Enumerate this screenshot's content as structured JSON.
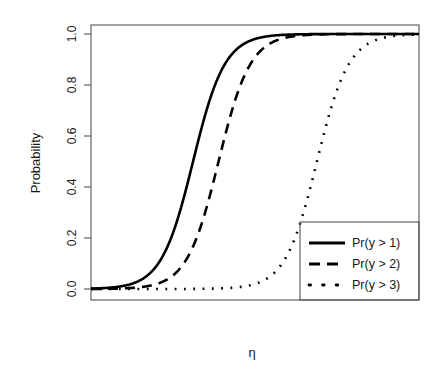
{
  "chart_data": {
    "type": "line",
    "title": "",
    "subtitle": "",
    "xlabel": "η",
    "ylabel": "Probability",
    "xlim": [
      -6,
      12
    ],
    "ylim": [
      0.0,
      1.0
    ],
    "grid": false,
    "legend_position": "bottom-right",
    "y_ticks": [
      "0.0",
      "0.2",
      "0.4",
      "0.6",
      "0.8",
      "1.0"
    ],
    "y_tick_values": [
      0.0,
      0.2,
      0.4,
      0.6,
      0.8,
      1.0
    ],
    "x_ticks": [],
    "x_tick_values": [],
    "x": [
      -6,
      -5.5,
      -5,
      -4.5,
      -4,
      -3.5,
      -3,
      -2.5,
      -2,
      -1.5,
      -1,
      -0.5,
      0,
      0.5,
      1,
      1.5,
      2,
      2.5,
      3,
      3.5,
      4,
      4.5,
      5,
      5.5,
      6,
      6.5,
      7,
      7.5,
      8,
      8.5,
      9,
      9.5,
      10,
      10.5,
      11,
      11.5,
      12
    ],
    "series": [
      {
        "name": "Pr(y > 1)",
        "style": "solid",
        "color": "#000000",
        "linewidth": 2.6,
        "midpoint": -0.4,
        "slope": 1.15,
        "values": [
          0.001,
          0.002,
          0.004,
          0.007,
          0.013,
          0.022,
          0.039,
          0.067,
          0.113,
          0.185,
          0.289,
          0.422,
          0.567,
          0.702,
          0.809,
          0.885,
          0.933,
          0.962,
          0.979,
          0.988,
          0.993,
          0.996,
          0.998,
          0.999,
          0.999,
          1.0,
          1.0,
          1.0,
          1.0,
          1.0,
          1.0,
          1.0,
          1.0,
          1.0,
          1.0,
          1.0,
          1.0
        ]
      },
      {
        "name": "Pr(y > 2)",
        "style": "dashed",
        "color": "#000000",
        "linewidth": 2.6,
        "midpoint": 1.0,
        "slope": 1.15,
        "values": [
          0.0003,
          0.0006,
          0.001,
          0.002,
          0.003,
          0.006,
          0.01,
          0.018,
          0.031,
          0.054,
          0.091,
          0.15,
          0.24,
          0.36,
          0.5,
          0.64,
          0.76,
          0.85,
          0.909,
          0.946,
          0.969,
          0.982,
          0.99,
          0.994,
          0.997,
          0.998,
          0.999,
          0.999,
          1.0,
          1.0,
          1.0,
          1.0,
          1.0,
          1.0,
          1.0,
          1.0,
          1.0
        ]
      },
      {
        "name": "Pr(y > 3)",
        "style": "dotted",
        "color": "#000000",
        "linewidth": 2.6,
        "midpoint": 6.4,
        "slope": 1.15,
        "values": [
          0.0,
          0.0,
          0.0,
          0.0,
          0.0,
          0.0,
          0.0,
          0.0,
          0.0,
          0.0,
          0.001,
          0.001,
          0.002,
          0.003,
          0.006,
          0.01,
          0.018,
          0.031,
          0.054,
          0.091,
          0.15,
          0.24,
          0.36,
          0.5,
          0.64,
          0.76,
          0.85,
          0.909,
          0.946,
          0.969,
          0.982,
          0.99,
          0.994,
          0.997,
          0.998,
          0.999,
          0.999
        ]
      }
    ],
    "legend_entries": [
      {
        "label": "Pr(y > 1)",
        "style": "solid"
      },
      {
        "label": "Pr(y > 2)",
        "style": "dashed"
      },
      {
        "label": "Pr(y > 3)",
        "style": "dotted"
      }
    ]
  },
  "axes": {
    "ylabel": "Probability",
    "xlabel": "η",
    "y_tick_labels": [
      "1.0",
      "0.8",
      "0.6",
      "0.4",
      "0.2",
      "0.0"
    ]
  },
  "legend": {
    "items": [
      {
        "label": "Pr(y > 1)"
      },
      {
        "label": "Pr(y > 2)"
      },
      {
        "label": "Pr(y > 3)"
      }
    ]
  },
  "colors": {
    "background": "#ffffff",
    "frame": "#555555",
    "curve": "#000000",
    "text": "#1a1a1a"
  }
}
